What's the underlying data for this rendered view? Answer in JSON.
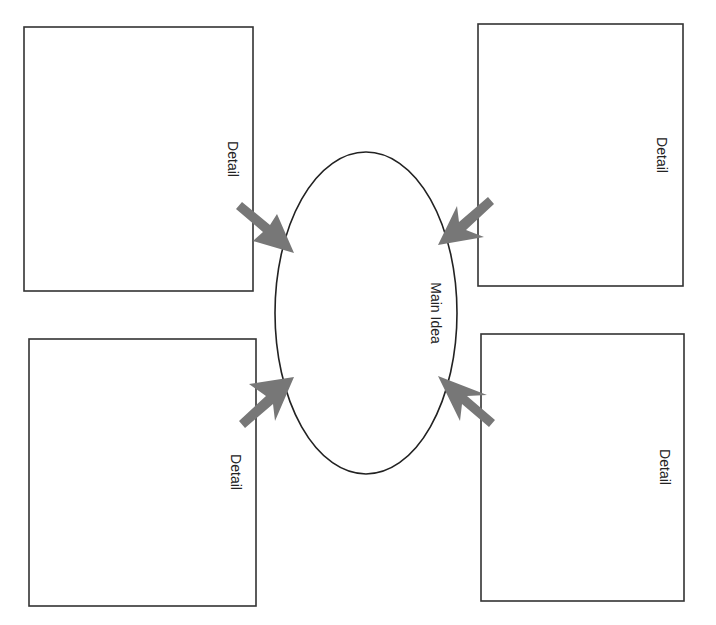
{
  "diagram": {
    "type": "main-idea-details-organizer",
    "orientation": "rotated 90deg clockwise",
    "center": {
      "label": "Main Idea",
      "shape": "ellipse"
    },
    "details": [
      {
        "label": "Detail",
        "position": "top-left"
      },
      {
        "label": "Detail",
        "position": "top-right"
      },
      {
        "label": "Detail",
        "position": "bottom-left"
      },
      {
        "label": "Detail",
        "position": "bottom-right"
      }
    ],
    "colors": {
      "stroke": "#333333",
      "arrow": "#777777",
      "background": "#ffffff",
      "text": "#222222"
    }
  }
}
